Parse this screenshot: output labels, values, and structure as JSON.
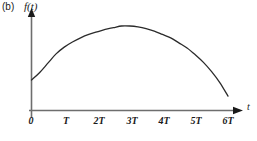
{
  "figure": {
    "panel_label": "(b)",
    "y_axis_label": "f(t)",
    "x_axis_label": "t",
    "curve_color": "#2b2b2b",
    "axis_color": "#6e6e6e",
    "text_color": "#1a1a1a",
    "background": "#ffffff"
  },
  "chart_data": {
    "type": "line",
    "title": "(b) f(t)",
    "xlabel": "t",
    "ylabel": "f(t)",
    "grid": false,
    "legend": false,
    "categories": [
      "0",
      "T",
      "2T",
      "3T",
      "4T",
      "5T",
      "6T"
    ],
    "x_tick_labels": [
      "0",
      "T",
      "2T",
      "3T",
      "4T",
      "5T",
      "6T"
    ],
    "x_tick_values": [
      0,
      1,
      2,
      3,
      4,
      5,
      6
    ],
    "xlim": [
      0,
      6.3
    ],
    "ylim": [
      0,
      1.05
    ],
    "series": [
      {
        "name": "f(t)",
        "x": [
          0.0,
          0.25,
          0.5,
          0.75,
          1.0,
          1.25,
          1.5,
          1.75,
          2.0,
          2.25,
          2.5,
          2.75,
          3.0,
          3.25,
          3.5,
          3.75,
          4.0,
          4.25,
          4.5,
          4.75,
          5.0,
          5.25,
          5.5,
          5.75,
          6.0
        ],
        "y": [
          0.36,
          0.45,
          0.56,
          0.67,
          0.75,
          0.81,
          0.86,
          0.9,
          0.93,
          0.96,
          0.98,
          1.0,
          1.0,
          0.99,
          0.97,
          0.94,
          0.9,
          0.86,
          0.8,
          0.74,
          0.66,
          0.57,
          0.46,
          0.33,
          0.17
        ]
      }
    ],
    "annotations": [
      {
        "text": "(b)",
        "position": "top-left"
      }
    ]
  }
}
